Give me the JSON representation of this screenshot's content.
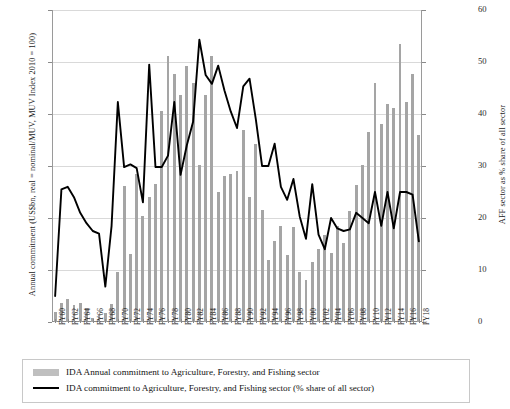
{
  "chart_data": {
    "type": "bar",
    "title": "",
    "xlabel": "",
    "ylabel": "Annual commitment (US$bn, real = nominal/MUV, MUV Index 2010 = 100)",
    "y2label": "AFF sector as % share of all sector",
    "ylim": [
      0,
      3
    ],
    "y2lim": [
      0,
      60
    ],
    "yticks": [
      "0",
      "0.5",
      "1",
      "1.5",
      "2",
      "2.5",
      "3"
    ],
    "y2ticks": [
      "0",
      "10",
      "20",
      "30",
      "40",
      "50",
      "60"
    ],
    "grid": true,
    "legend_position": "below-axes",
    "categories": [
      "FY60",
      "FY61",
      "FY62",
      "FY63",
      "FY64",
      "FY65",
      "FY66",
      "FY67",
      "FY68",
      "FY69",
      "FY70",
      "FY71",
      "FY72",
      "FY73",
      "FY74",
      "FY75",
      "FY76",
      "FY77",
      "FY78",
      "FY79",
      "FY80",
      "FY81",
      "FY82",
      "FY83",
      "FY84",
      "FY85",
      "FY86",
      "FY87",
      "FY88",
      "FY89",
      "FY90",
      "FY91",
      "FY92",
      "FY93",
      "FY94",
      "FY95",
      "FY96",
      "FY97",
      "FY98",
      "FY99",
      "FY00",
      "FY01",
      "FY02",
      "FY03",
      "FY04",
      "FY05",
      "FY06",
      "FY07",
      "FY08",
      "FY09",
      "FY10",
      "FY11",
      "FY12",
      "FY13",
      "FY14",
      "FY15",
      "FY16",
      "FY17",
      "FY18"
    ],
    "xtick_labels_shown": [
      "FY60",
      "FY62",
      "FY64",
      "FY66",
      "FY68",
      "FY70",
      "FY72",
      "FY74",
      "FY76",
      "FY78",
      "FY80",
      "FY82",
      "FY84",
      "FY86",
      "FY88",
      "FY90",
      "FY92",
      "FY94",
      "FY96",
      "FY98",
      "FY00",
      "FY02",
      "FY04",
      "FY06",
      "FY08",
      "FY10",
      "FY12",
      "FY14",
      "FY16",
      "FY18"
    ],
    "series": [
      {
        "name": "IDA Annual commitment to Agriculture, Forestry, and Fishing sector",
        "type": "bar",
        "axis": "left",
        "unit": "US$bn real",
        "color": "#a5a5a5",
        "values": [
          0.1,
          0.18,
          0.22,
          0.16,
          0.18,
          0.13,
          0.04,
          0.07,
          0.09,
          0.17,
          0.48,
          1.31,
          0.65,
          1.42,
          1.02,
          1.2,
          1.33,
          2.03,
          2.56,
          2.38,
          2.18,
          2.46,
          2.3,
          1.51,
          2.18,
          2.56,
          1.25,
          1.4,
          1.42,
          1.45,
          1.85,
          1.2,
          1.71,
          1.08,
          0.6,
          0.78,
          0.92,
          0.64,
          0.91,
          0.48,
          0.4,
          0.58,
          0.7,
          0.84,
          0.66,
          0.92,
          0.76,
          1.07,
          1.32,
          1.51,
          1.83,
          2.3,
          1.9,
          2.1,
          2.06,
          2.67,
          2.12,
          2.38,
          1.8
        ]
      },
      {
        "name": "IDA commitment to Agriculture, Forestry, and Fishing sector (% share of all sector)",
        "type": "line",
        "axis": "right",
        "unit": "% share",
        "color": "#000000",
        "values": [
          5.0,
          25.5,
          26.0,
          24.0,
          21.0,
          19.0,
          17.5,
          17.0,
          6.8,
          18.5,
          42.3,
          29.8,
          30.3,
          29.6,
          23.0,
          49.5,
          29.8,
          29.8,
          32.0,
          42.3,
          28.3,
          34.0,
          38.5,
          54.3,
          47.5,
          45.8,
          49.3,
          44.5,
          40.5,
          37.3,
          45.3,
          46.8,
          39.0,
          30.0,
          30.0,
          34.3,
          26.0,
          23.5,
          27.5,
          20.3,
          16.0,
          26.5,
          16.8,
          14.0,
          20.0,
          18.0,
          17.5,
          17.8,
          21.0,
          20.0,
          19.0,
          25.0,
          18.5,
          25.0,
          18.0,
          25.0,
          25.0,
          24.5,
          15.5
        ]
      }
    ],
    "legend": [
      {
        "marker": "bar-swatch",
        "label": "IDA Annual commitment to Agriculture, Forestry, and Fishing sector"
      },
      {
        "marker": "line-swatch",
        "label": "IDA commitment to Agriculture, Forestry, and Fishing sector (% share of all sector)"
      }
    ],
    "colors": {
      "bar": "#a5a5a5",
      "line": "#000000",
      "grid": "#d9d9d9",
      "axis": "#8a8a8a",
      "text": "#1a1a1a"
    }
  }
}
